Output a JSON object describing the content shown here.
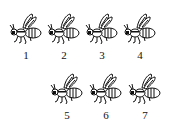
{
  "figures": [
    {
      "label": "1",
      "x": 8,
      "y": 13
    },
    {
      "label": "2",
      "x": 46,
      "y": 13
    },
    {
      "label": "3",
      "x": 84,
      "y": 13
    },
    {
      "label": "4",
      "x": 122,
      "y": 13
    },
    {
      "label": "5",
      "x": 49,
      "y": 73
    },
    {
      "label": "6",
      "x": 88,
      "y": 73
    },
    {
      "label": "7",
      "x": 127,
      "y": 73
    }
  ],
  "colors": {
    "ink": "#111111",
    "background": "#ffffff"
  }
}
